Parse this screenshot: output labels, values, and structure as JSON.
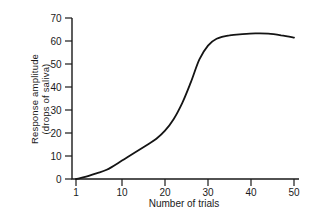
{
  "figure": {
    "background": "#ffffff"
  },
  "chart_data": {
    "type": "line",
    "title": "",
    "xlabel": "Number of trials",
    "ylabel": "Response amplitude (drops of saliva)",
    "ylabel_line1": "Response amplitude",
    "ylabel_line2": "(drops of saliva)",
    "x_ticks": [
      1,
      10,
      20,
      30,
      40,
      50
    ],
    "y_ticks": [
      0,
      10,
      20,
      30,
      40,
      50,
      60,
      70
    ],
    "xlim": [
      1,
      50
    ],
    "ylim": [
      0,
      70
    ],
    "grid": false,
    "legend": "none",
    "series": [
      {
        "name": "conditioned-response-learning-curve",
        "x": [
          1,
          3,
          5,
          7,
          10,
          13,
          16,
          18,
          20,
          22,
          24,
          26,
          28,
          30,
          32,
          35,
          38,
          41,
          44,
          47,
          50
        ],
        "y": [
          0,
          1,
          2.5,
          4,
          8,
          11.5,
          15,
          17.5,
          21,
          26,
          33,
          42,
          52,
          58,
          61,
          62.5,
          63,
          63.3,
          63.2,
          62.5,
          61.5
        ]
      }
    ],
    "colors": {
      "curve": "#141414",
      "axis": "#1a1a1a",
      "text": "#1a1a1a"
    }
  }
}
